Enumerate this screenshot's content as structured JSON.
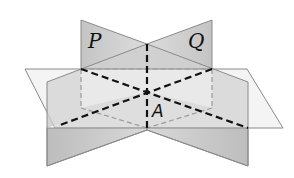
{
  "figure": {
    "labels": {
      "plane_p": "P",
      "plane_q": "Q",
      "point_a": "A"
    },
    "colors": {
      "vertical_plane_fill": "#c8c8c8",
      "vertical_plane_back_fill": "#d2d2d2",
      "horizontal_plane_fill": "#f2f2f2",
      "edge_stroke": "#8a8a8a",
      "dashed_hidden": "#9a9a9a",
      "dashed_bold": "#111111"
    }
  }
}
